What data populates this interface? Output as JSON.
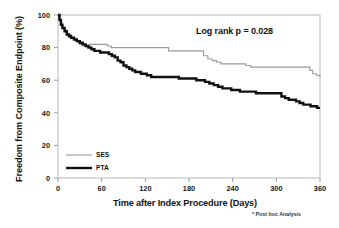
{
  "chart_data": {
    "type": "line",
    "subtype": "kaplan-meier-step",
    "title": "",
    "xlabel": "Time after Index Procedure (Days)",
    "ylabel": "Freedom from Composite Endpoint (%)",
    "xlim": [
      0,
      360
    ],
    "ylim": [
      0,
      100
    ],
    "xticks": [
      0,
      60,
      120,
      180,
      240,
      300,
      360
    ],
    "yticks": [
      0,
      20,
      40,
      60,
      80,
      100
    ],
    "grid": false,
    "legend_position": "lower-left-inside",
    "annotations": [
      {
        "text": "Log rank p = 0.028",
        "x": 240,
        "y": 88
      }
    ],
    "footnote": "* Post hoc  Analysis",
    "series": [
      {
        "name": "SES",
        "color": "#9a9a9a",
        "linewidth": 1.1,
        "final_value": 62,
        "points": [
          [
            0,
            100
          ],
          [
            3,
            96
          ],
          [
            5,
            93
          ],
          [
            8,
            91
          ],
          [
            11,
            89
          ],
          [
            14,
            88
          ],
          [
            18,
            86
          ],
          [
            21,
            85
          ],
          [
            24,
            84
          ],
          [
            27,
            83
          ],
          [
            30,
            82
          ],
          [
            33,
            81
          ],
          [
            36,
            81
          ],
          [
            40,
            80
          ],
          [
            44,
            82
          ],
          [
            48,
            82
          ],
          [
            53,
            82
          ],
          [
            58,
            82
          ],
          [
            63,
            82
          ],
          [
            68,
            81
          ],
          [
            73,
            80
          ],
          [
            80,
            80
          ],
          [
            90,
            80
          ],
          [
            100,
            80
          ],
          [
            115,
            80
          ],
          [
            130,
            80
          ],
          [
            142,
            80
          ],
          [
            150,
            80
          ],
          [
            152,
            78
          ],
          [
            160,
            78
          ],
          [
            170,
            78
          ],
          [
            180,
            78
          ],
          [
            190,
            78
          ],
          [
            198,
            78
          ],
          [
            200,
            75
          ],
          [
            206,
            73
          ],
          [
            212,
            72
          ],
          [
            218,
            71
          ],
          [
            224,
            70
          ],
          [
            232,
            70
          ],
          [
            240,
            70
          ],
          [
            250,
            70
          ],
          [
            258,
            69
          ],
          [
            265,
            68
          ],
          [
            275,
            68
          ],
          [
            290,
            68
          ],
          [
            305,
            68
          ],
          [
            320,
            68
          ],
          [
            330,
            68
          ],
          [
            340,
            68
          ],
          [
            346,
            66
          ],
          [
            350,
            64
          ],
          [
            355,
            63
          ],
          [
            360,
            62
          ]
        ]
      },
      {
        "name": "PTA",
        "color": "#111111",
        "linewidth": 2.4,
        "final_value": 43,
        "points": [
          [
            0,
            100
          ],
          [
            2,
            97
          ],
          [
            4,
            94
          ],
          [
            6,
            92
          ],
          [
            9,
            90
          ],
          [
            12,
            88
          ],
          [
            15,
            87
          ],
          [
            18,
            86
          ],
          [
            22,
            85
          ],
          [
            26,
            84
          ],
          [
            30,
            83
          ],
          [
            34,
            82
          ],
          [
            38,
            81
          ],
          [
            42,
            80
          ],
          [
            46,
            79
          ],
          [
            50,
            78
          ],
          [
            54,
            78
          ],
          [
            58,
            77
          ],
          [
            62,
            77
          ],
          [
            66,
            77
          ],
          [
            70,
            76
          ],
          [
            74,
            75
          ],
          [
            78,
            74
          ],
          [
            82,
            72
          ],
          [
            86,
            71
          ],
          [
            90,
            69
          ],
          [
            94,
            68
          ],
          [
            98,
            67
          ],
          [
            102,
            66
          ],
          [
            106,
            65
          ],
          [
            110,
            65
          ],
          [
            114,
            64
          ],
          [
            118,
            64
          ],
          [
            122,
            63
          ],
          [
            128,
            62
          ],
          [
            134,
            62
          ],
          [
            142,
            62
          ],
          [
            150,
            62
          ],
          [
            158,
            62
          ],
          [
            166,
            61
          ],
          [
            174,
            61
          ],
          [
            182,
            61
          ],
          [
            190,
            60
          ],
          [
            196,
            60
          ],
          [
            202,
            59
          ],
          [
            208,
            58
          ],
          [
            214,
            57
          ],
          [
            220,
            56
          ],
          [
            226,
            55
          ],
          [
            232,
            55
          ],
          [
            238,
            54
          ],
          [
            244,
            54
          ],
          [
            250,
            53
          ],
          [
            256,
            53
          ],
          [
            262,
            53
          ],
          [
            268,
            53
          ],
          [
            272,
            52
          ],
          [
            280,
            52
          ],
          [
            288,
            52
          ],
          [
            294,
            52
          ],
          [
            300,
            52
          ],
          [
            304,
            52
          ],
          [
            307,
            50
          ],
          [
            312,
            49
          ],
          [
            317,
            48
          ],
          [
            322,
            48
          ],
          [
            327,
            47
          ],
          [
            332,
            46
          ],
          [
            337,
            45
          ],
          [
            342,
            45
          ],
          [
            347,
            44
          ],
          [
            352,
            44
          ],
          [
            356,
            43
          ],
          [
            360,
            43
          ]
        ]
      }
    ]
  },
  "legend": {
    "entries": [
      {
        "label": "SES"
      },
      {
        "label": "PTA"
      }
    ]
  },
  "axis": {
    "y_tick_labels": [
      "100",
      "80",
      "60",
      "40",
      "20",
      "0"
    ],
    "x_tick_labels": [
      "0",
      "60",
      "120",
      "180",
      "240",
      "300",
      "360"
    ]
  }
}
